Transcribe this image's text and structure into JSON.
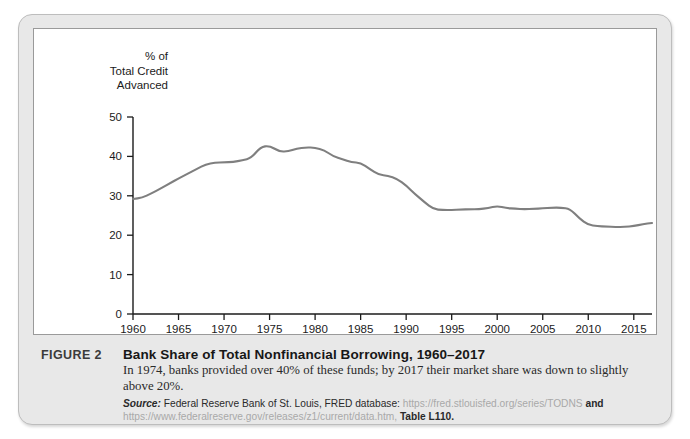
{
  "figure": {
    "label": "FIGURE 2",
    "title": "Bank Share of Total Nonfinancial Borrowing, 1960–2017",
    "body": "In 1974, banks provided over 40% of these funds; by 2017 their market share was down to slightly above 20%.",
    "source_word": "Source:",
    "source_text": "Federal Reserve Bank of St. Louis, FRED database:",
    "source_url_1": "https://fred.stlouisfed.org/series/TODNS",
    "source_and": "and",
    "source_url_2": "https://www.federalreserve.gov/releases/z1/current/data.htm,",
    "source_table": "Table L110."
  },
  "chart_data": {
    "type": "line",
    "title": "",
    "xlabel": "",
    "ylabel": "% of\nTotal Credit\nAdvanced",
    "xlim": [
      1960,
      2017
    ],
    "ylim": [
      0,
      50
    ],
    "xticks": [
      1960,
      1965,
      1970,
      1975,
      1980,
      1985,
      1990,
      1995,
      2000,
      2005,
      2010,
      2015
    ],
    "yticks": [
      0,
      10,
      20,
      30,
      40,
      50
    ],
    "grid": false,
    "legend": "none",
    "line_color": "#7f7f7f",
    "series": [
      {
        "name": "Bank share of total nonfinancial borrowing",
        "x": [
          1960,
          1961,
          1962,
          1963,
          1964,
          1965,
          1966,
          1967,
          1968,
          1969,
          1970,
          1971,
          1972,
          1973,
          1974,
          1975,
          1976,
          1977,
          1978,
          1979,
          1980,
          1981,
          1982,
          1983,
          1984,
          1985,
          1986,
          1987,
          1988,
          1989,
          1990,
          1991,
          1992,
          1993,
          1994,
          1995,
          1996,
          1997,
          1998,
          1999,
          2000,
          2001,
          2002,
          2003,
          2004,
          2005,
          2006,
          2007,
          2008,
          2009,
          2010,
          2011,
          2012,
          2013,
          2014,
          2015,
          2016,
          2017
        ],
        "values": [
          29.2,
          29.5,
          30.6,
          31.8,
          33.1,
          34.4,
          35.6,
          36.8,
          38.0,
          38.4,
          38.5,
          38.6,
          39.0,
          39.6,
          42.4,
          42.7,
          41.3,
          41.2,
          42.0,
          42.3,
          42.2,
          41.6,
          40.0,
          39.3,
          38.5,
          38.4,
          36.8,
          35.3,
          35.1,
          34.3,
          32.6,
          30.4,
          28.4,
          26.6,
          26.4,
          26.4,
          26.5,
          26.6,
          26.6,
          26.9,
          27.4,
          26.9,
          26.7,
          26.6,
          26.7,
          26.8,
          27.0,
          27.0,
          26.7,
          24.3,
          22.6,
          22.3,
          22.2,
          22.1,
          22.1,
          22.3,
          22.8,
          23.1
        ]
      }
    ]
  }
}
